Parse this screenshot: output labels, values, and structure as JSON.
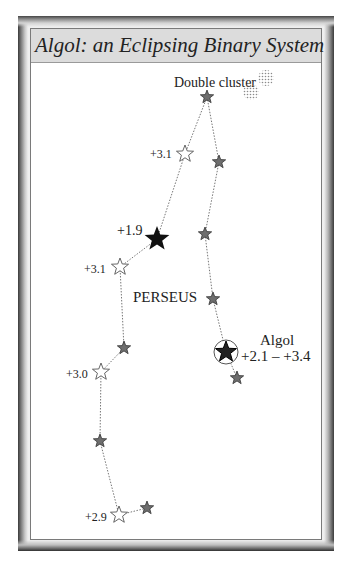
{
  "title": "Algol: an Eclipsing Binary System",
  "constellation_label": "PERSEUS",
  "double_cluster_label": "Double cluster",
  "algol": {
    "name": "Algol",
    "magnitude_range": "+2.1 – +3.4"
  },
  "magnitude_labels": [
    {
      "text": "+3.1",
      "x": 150,
      "y": 158
    },
    {
      "text": "+1.9",
      "x": 117,
      "y": 235
    },
    {
      "text": "+3.1",
      "x": 84,
      "y": 273
    },
    {
      "text": "+3.0",
      "x": 66,
      "y": 378
    },
    {
      "text": "+2.9",
      "x": 85,
      "y": 521
    }
  ],
  "stars": [
    {
      "id": "s1",
      "x": 207,
      "y": 97,
      "type": "gray",
      "r": 7
    },
    {
      "id": "s2",
      "x": 185,
      "y": 154,
      "type": "open",
      "r": 9
    },
    {
      "id": "s3",
      "x": 219,
      "y": 162,
      "type": "gray",
      "r": 7
    },
    {
      "id": "s4",
      "x": 157,
      "y": 239,
      "type": "black",
      "r": 13
    },
    {
      "id": "s5",
      "x": 205,
      "y": 234,
      "type": "gray",
      "r": 7
    },
    {
      "id": "s6",
      "x": 120,
      "y": 267,
      "type": "open",
      "r": 9
    },
    {
      "id": "s7",
      "x": 213,
      "y": 299,
      "type": "gray",
      "r": 7
    },
    {
      "id": "s8",
      "x": 226,
      "y": 352,
      "type": "algol",
      "r": 11
    },
    {
      "id": "s9",
      "x": 237,
      "y": 378,
      "type": "gray",
      "r": 7
    },
    {
      "id": "s10",
      "x": 124,
      "y": 348,
      "type": "gray",
      "r": 7
    },
    {
      "id": "s11",
      "x": 101,
      "y": 372,
      "type": "open",
      "r": 9
    },
    {
      "id": "s12",
      "x": 100,
      "y": 441,
      "type": "gray",
      "r": 7
    },
    {
      "id": "s13",
      "x": 119,
      "y": 515,
      "type": "open",
      "r": 9
    },
    {
      "id": "s14",
      "x": 147,
      "y": 508,
      "type": "gray",
      "r": 7
    }
  ],
  "lines": [
    [
      "s1",
      "s2"
    ],
    [
      "s1",
      "s3"
    ],
    [
      "s2",
      "s4"
    ],
    [
      "s3",
      "s5"
    ],
    [
      "s4",
      "s6"
    ],
    [
      "s5",
      "s7"
    ],
    [
      "s7",
      "s8"
    ],
    [
      "s8",
      "s9"
    ],
    [
      "s6",
      "s10"
    ],
    [
      "s10",
      "s11"
    ],
    [
      "s11",
      "s12"
    ],
    [
      "s12",
      "s13"
    ],
    [
      "s13",
      "s14"
    ]
  ],
  "colors": {
    "black_star": "#111111",
    "gray_star": "#6e6e6e",
    "open_star_stroke": "#555555",
    "line": "#777777",
    "title_bg": "#dcdcdc"
  }
}
